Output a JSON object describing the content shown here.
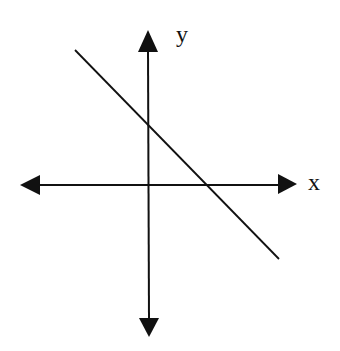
{
  "diagram": {
    "colors": {
      "background": "#ffffff",
      "ink": "#111111"
    },
    "x_axis": {
      "label": "x",
      "direction": "bidirectional arrows"
    },
    "y_axis": {
      "label": "y",
      "direction": "bidirectional arrows"
    },
    "line": {
      "slope": "negative",
      "y_intercept": "positive",
      "x_intercept": "positive"
    }
  }
}
